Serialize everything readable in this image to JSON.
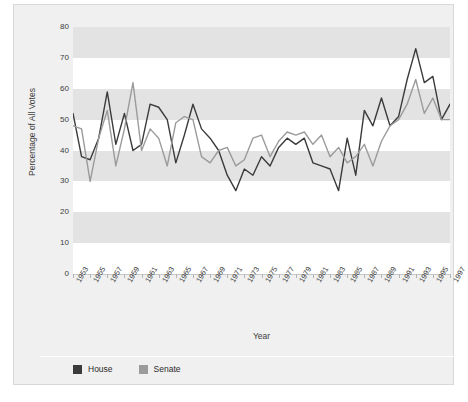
{
  "chart_data": {
    "type": "line",
    "title": "",
    "xlabel": "Year",
    "ylabel": "Percentage of All Votes",
    "xlim": [
      1953,
      1997
    ],
    "ylim": [
      0,
      80
    ],
    "grid": "horizontal-bands",
    "legend_position": "bottom-left",
    "x": [
      1953,
      1954,
      1955,
      1956,
      1957,
      1958,
      1959,
      1960,
      1961,
      1962,
      1963,
      1964,
      1965,
      1966,
      1967,
      1968,
      1969,
      1970,
      1971,
      1972,
      1973,
      1974,
      1975,
      1976,
      1977,
      1978,
      1979,
      1980,
      1981,
      1982,
      1983,
      1984,
      1985,
      1986,
      1987,
      1988,
      1989,
      1990,
      1991,
      1992,
      1993,
      1994,
      1995,
      1996,
      1997
    ],
    "xtick_labels": [
      "1953",
      "1955",
      "1957",
      "1959",
      "1961",
      "1963",
      "1965",
      "1967",
      "1969",
      "1971",
      "1973",
      "1975",
      "1977",
      "1979",
      "1981",
      "1983",
      "1985",
      "1987",
      "1989",
      "1991",
      "1993",
      "1995",
      "1997"
    ],
    "ytick_labels": [
      "0",
      "10",
      "20",
      "30",
      "40",
      "50",
      "60",
      "70",
      "80"
    ],
    "series": [
      {
        "name": "House",
        "color": "#3b3b3b",
        "values": [
          52,
          38,
          37,
          44,
          59,
          42,
          52,
          40,
          42,
          55,
          54,
          50,
          36,
          45,
          55,
          47,
          44,
          40,
          32,
          27,
          34,
          32,
          38,
          35,
          41,
          44,
          42,
          44,
          36,
          35,
          34,
          27,
          44,
          32,
          53,
          48,
          57,
          48,
          51,
          63,
          73,
          62,
          64,
          50,
          55
        ]
      },
      {
        "name": "Senate",
        "color": "#9b9b9b",
        "values": [
          48,
          47,
          30,
          44,
          53,
          35,
          47,
          62,
          40,
          47,
          44,
          35,
          49,
          51,
          50,
          38,
          36,
          40,
          41,
          35,
          37,
          44,
          45,
          38,
          43,
          46,
          45,
          46,
          42,
          45,
          38,
          41,
          36,
          38,
          42,
          35,
          43,
          48,
          50,
          55,
          63,
          52,
          57,
          50,
          50
        ]
      }
    ]
  },
  "legend": {
    "items": [
      {
        "label": "House",
        "color": "#3b3b3b"
      },
      {
        "label": "Senate",
        "color": "#9b9b9b"
      }
    ]
  },
  "axes": {
    "y_title": "Percentage of All Votes",
    "x_title": "Year"
  }
}
